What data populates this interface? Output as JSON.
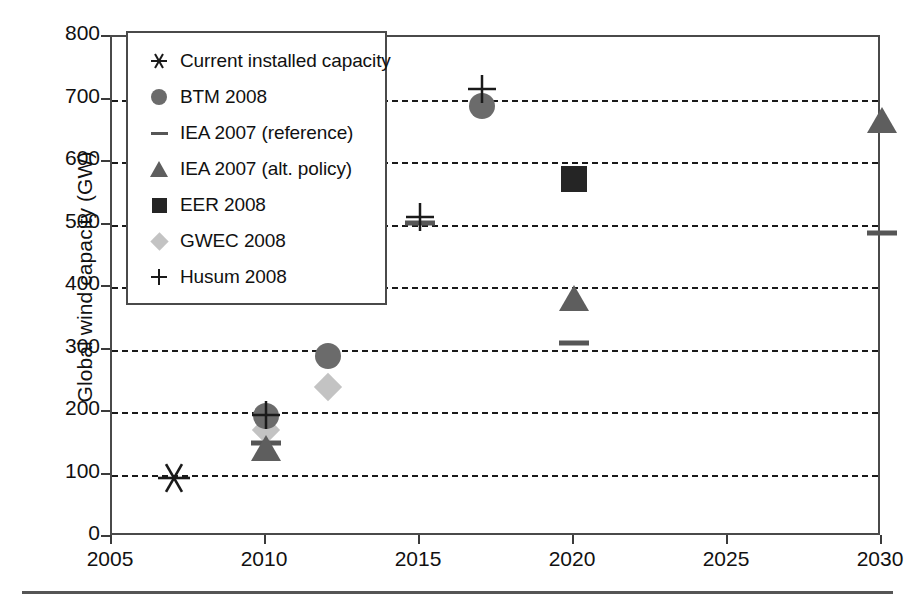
{
  "chart_data": {
    "type": "scatter",
    "title": "",
    "xlabel": "",
    "ylabel": "Global wind capacity (GW)",
    "xlim": [
      2005,
      2030
    ],
    "ylim": [
      0,
      800
    ],
    "xticks": [
      "2005",
      "2010",
      "2015",
      "2020",
      "2025",
      "2030"
    ],
    "xtick_values": [
      2005,
      2010,
      2015,
      2020,
      2025,
      2030
    ],
    "yticks": [
      "0",
      "100",
      "200",
      "300",
      "400",
      "500",
      "600",
      "700",
      "800"
    ],
    "ytick_values": [
      0,
      100,
      200,
      300,
      400,
      500,
      600,
      700,
      800
    ],
    "grid": "horizontal-dashed",
    "legend_position": "top-left-inside",
    "series": [
      {
        "name": "Current installed capacity",
        "marker": "star",
        "color": "#1a1a1a",
        "points": [
          {
            "x": 2007,
            "y": 94
          }
        ]
      },
      {
        "name": "BTM 2008",
        "marker": "circle",
        "color": "#6b6b6b",
        "points": [
          {
            "x": 2010,
            "y": 193
          },
          {
            "x": 2012,
            "y": 290
          },
          {
            "x": 2017,
            "y": 690
          }
        ]
      },
      {
        "name": "IEA 2007 (reference)",
        "marker": "dash",
        "color": "#565656",
        "points": [
          {
            "x": 2010,
            "y": 150
          },
          {
            "x": 2015,
            "y": 503
          },
          {
            "x": 2020,
            "y": 310
          },
          {
            "x": 2030,
            "y": 487
          }
        ]
      },
      {
        "name": "IEA 2007 (alt. policy)",
        "marker": "triangle",
        "color": "#5e5e5e",
        "points": [
          {
            "x": 2010,
            "y": 143
          },
          {
            "x": 2020,
            "y": 383
          },
          {
            "x": 2030,
            "y": 668
          }
        ]
      },
      {
        "name": "EER 2008",
        "marker": "square",
        "color": "#252525",
        "points": [
          {
            "x": 2020,
            "y": 573
          }
        ]
      },
      {
        "name": "GWEC 2008",
        "marker": "diamond",
        "color": "#c3c3c3",
        "points": [
          {
            "x": 2010,
            "y": 172
          },
          {
            "x": 2012,
            "y": 240
          }
        ]
      },
      {
        "name": "Husum 2008",
        "marker": "plus",
        "color": "#1a1a1a",
        "points": [
          {
            "x": 2010,
            "y": 196
          },
          {
            "x": 2015,
            "y": 512
          },
          {
            "x": 2017,
            "y": 717
          }
        ]
      }
    ]
  },
  "legend": {
    "items": [
      {
        "label": "Current installed capacity",
        "marker": "star",
        "color": "#1a1a1a"
      },
      {
        "label": "BTM 2008",
        "marker": "circle",
        "color": "#6b6b6b"
      },
      {
        "label": "IEA 2007 (reference)",
        "marker": "dash",
        "color": "#565656"
      },
      {
        "label": "IEA 2007 (alt. policy)",
        "marker": "triangle",
        "color": "#5e5e5e"
      },
      {
        "label": "EER 2008",
        "marker": "square",
        "color": "#252525"
      },
      {
        "label": "GWEC 2008",
        "marker": "diamond",
        "color": "#c3c3c3"
      },
      {
        "label": "Husum 2008",
        "marker": "plus",
        "color": "#1a1a1a"
      }
    ]
  }
}
